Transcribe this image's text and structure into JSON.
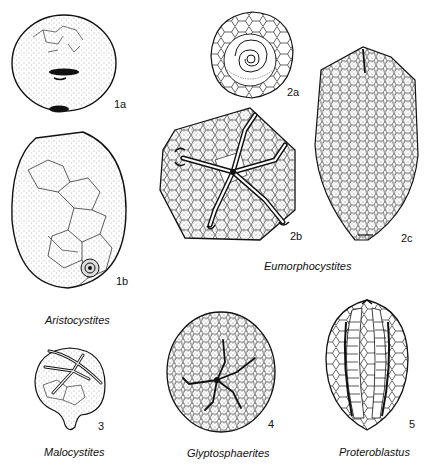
{
  "plate": {
    "figures": [
      {
        "id": "1a",
        "label": "1a"
      },
      {
        "id": "1b",
        "label": "1b"
      },
      {
        "id": "2a",
        "label": "2a"
      },
      {
        "id": "2b",
        "label": "2b"
      },
      {
        "id": "2c",
        "label": "2c"
      },
      {
        "id": "3",
        "label": "3"
      },
      {
        "id": "4",
        "label": "4"
      },
      {
        "id": "5",
        "label": "5"
      }
    ],
    "genera": {
      "aristocystites": "Aristocystites",
      "eumorphocystites": "Eumorphocystites",
      "malocystites": "Malocystites",
      "glyptosphaerites": "Glyptosphaerites",
      "proteroblastus": "Proteroblastus"
    }
  }
}
